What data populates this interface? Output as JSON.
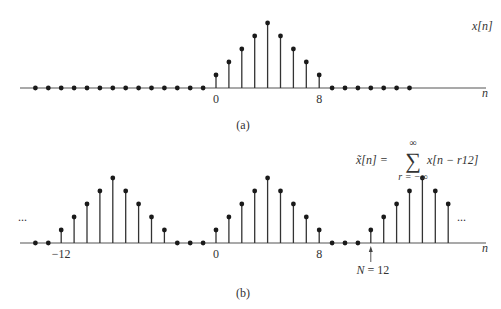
{
  "panels": [
    {
      "id": "a",
      "caption": "(a)",
      "signal_label": "x[n]",
      "axis_label": "n",
      "tick_labels": [
        {
          "n": 0,
          "text": "0"
        },
        {
          "n": 8,
          "text": "8"
        }
      ],
      "n_start": -14,
      "values": [
        0,
        0,
        0,
        0,
        0,
        0,
        0,
        0,
        0,
        0,
        0,
        0,
        0,
        0,
        1,
        2,
        3,
        4,
        5,
        4,
        3,
        2,
        1,
        0,
        0,
        0,
        0,
        0,
        0,
        0
      ],
      "ellipsis_left": "",
      "ellipsis_right": ""
    },
    {
      "id": "b",
      "caption": "(b)",
      "signal_label": "x̃[n] = Σ x[n − r12]",
      "formula": {
        "lhs": "x̃[n] =",
        "sum_symbol": "∑",
        "upper_limit": "∞",
        "lower_limit": "r = −∞",
        "summand": "x[n − r12]"
      },
      "axis_label": "n",
      "tick_labels": [
        {
          "n": -12,
          "text": "−12"
        },
        {
          "n": 0,
          "text": "0"
        },
        {
          "n": 8,
          "text": "8"
        }
      ],
      "period_annotation": {
        "n": 12,
        "text": "N = 12"
      },
      "n_start": -14,
      "values": [
        0,
        0,
        1,
        2,
        3,
        4,
        5,
        4,
        3,
        2,
        1,
        0,
        0,
        0,
        1,
        2,
        3,
        4,
        5,
        4,
        3,
        2,
        1,
        0,
        0,
        0,
        1,
        2,
        3,
        4,
        5,
        4,
        3
      ],
      "ellipsis_left": "...",
      "ellipsis_right": "..."
    }
  ],
  "chart_data": [
    {
      "type": "stem",
      "title": "(a) x[n]",
      "xlabel": "n",
      "ylabel": "x[n]",
      "x": [
        -14,
        -13,
        -12,
        -11,
        -10,
        -9,
        -8,
        -7,
        -6,
        -5,
        -4,
        -3,
        -2,
        -1,
        0,
        1,
        2,
        3,
        4,
        5,
        6,
        7,
        8,
        9,
        10,
        11,
        12,
        13,
        14,
        15
      ],
      "values": [
        0,
        0,
        0,
        0,
        0,
        0,
        0,
        0,
        0,
        0,
        0,
        0,
        0,
        0,
        1,
        2,
        3,
        4,
        5,
        4,
        3,
        2,
        1,
        0,
        0,
        0,
        0,
        0,
        0,
        0
      ],
      "xticks": [
        0,
        8
      ],
      "ylim": [
        0,
        5
      ]
    },
    {
      "type": "stem",
      "title": "(b) periodic extension, N = 12",
      "xlabel": "n",
      "ylabel": "x̃[n]",
      "x": [
        -14,
        -13,
        -12,
        -11,
        -10,
        -9,
        -8,
        -7,
        -6,
        -5,
        -4,
        -3,
        -2,
        -1,
        0,
        1,
        2,
        3,
        4,
        5,
        6,
        7,
        8,
        9,
        10,
        11,
        12,
        13,
        14,
        15,
        16,
        17,
        18
      ],
      "values": [
        0,
        0,
        1,
        2,
        3,
        4,
        5,
        4,
        3,
        2,
        1,
        0,
        0,
        0,
        1,
        2,
        3,
        4,
        5,
        4,
        3,
        2,
        1,
        0,
        0,
        0,
        1,
        2,
        3,
        4,
        5,
        4,
        3
      ],
      "xticks": [
        -12,
        0,
        8
      ],
      "annotation": "N = 12",
      "ylim": [
        0,
        5
      ]
    }
  ]
}
